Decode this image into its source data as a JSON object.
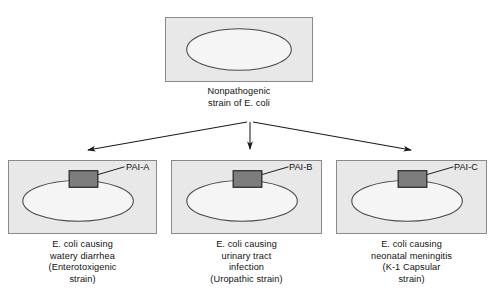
{
  "diagram": {
    "title_alt": "Horizontal gene transfer of pathogenicity islands in E. coli",
    "colors": {
      "cell_fill": "#e8e8e8",
      "cell_border": "#8a8a8a",
      "nucleoid_fill": "#f5f5f5",
      "nucleoid_border": "#4a4a4a",
      "pai_fill": "#7d7d7d",
      "pai_border": "#2b2b2b",
      "arrow": "#1a1a1a",
      "text": "#111111",
      "background": "#ffffff"
    },
    "parent": {
      "caption": "Nonpathogenic\nstrain of E. coli",
      "cell_name": "nonpathogenic-e-coli-cell"
    },
    "children": [
      {
        "pai_label": "PAI-A",
        "caption": "E. coli causing\nwatery diarrhea\n(Enterotoxigenic\nstrain)",
        "cell_name": "enterotoxigenic-e-coli-cell"
      },
      {
        "pai_label": "PAI-B",
        "caption": "E. coli causing\nurinary tract\ninfection\n(Uropathic strain)",
        "cell_name": "uropathic-e-coli-cell"
      },
      {
        "pai_label": "PAI-C",
        "caption": "E. coli causing\nneonatal meningitis\n(K-1 Capsular\nstrain)",
        "cell_name": "k1-capsular-e-coli-cell"
      }
    ],
    "arrows": [
      {
        "name": "arrow-to-left-cell",
        "from": [
          250,
          122
        ],
        "to": [
          85,
          152
        ]
      },
      {
        "name": "arrow-to-middle-cell",
        "from": [
          250,
          122
        ],
        "to": [
          250,
          152
        ]
      },
      {
        "name": "arrow-to-right-cell",
        "from": [
          250,
          122
        ],
        "to": [
          414,
          152
        ]
      }
    ]
  }
}
